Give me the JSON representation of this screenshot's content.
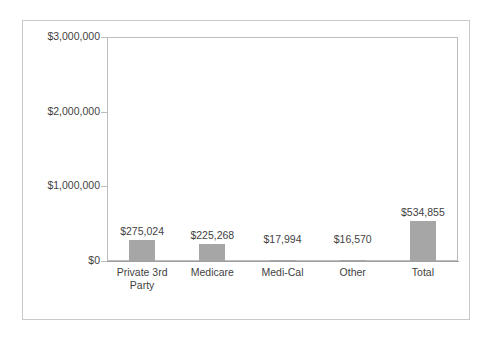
{
  "chart_data": {
    "type": "bar",
    "title": "",
    "subtitle": "",
    "xlabel": "",
    "ylabel": "",
    "categories": [
      "Private 3rd Party",
      "Medicare",
      "Medi-Cal",
      "Other",
      "Total"
    ],
    "values": [
      275024,
      225268,
      17994,
      16570,
      534855
    ],
    "data_labels": [
      "$275,024",
      "$225,268",
      "$17,994",
      "$16,570",
      "$534,855"
    ],
    "ylim": [
      0,
      3000000
    ],
    "ytick_values": [
      0,
      1000000,
      2000000,
      3000000
    ],
    "ytick_labels": [
      "$0",
      "$1,000,000",
      "$2,000,000",
      "$3,000,000"
    ],
    "grid": false,
    "legend": false,
    "legend_position": "none",
    "bar_color": "#a6a6a6",
    "axis_color": "#bdbdbd",
    "text_color": "#3f3f3f",
    "plot_background": "#ffffff",
    "frame_color": "#c9c9c9"
  },
  "axis": {
    "y_labels": [
      {
        "text": "$3,000,000",
        "value": 3000000
      },
      {
        "text": "$2,000,000",
        "value": 2000000
      },
      {
        "text": "$1,000,000",
        "value": 1000000
      },
      {
        "text": "$0",
        "value": 0
      }
    ]
  },
  "series": [
    {
      "category": "Private 3rd Party",
      "category_display": "Private 3rd\nParty",
      "value": 275024,
      "label": "$275,024"
    },
    {
      "category": "Medicare",
      "category_display": "Medicare",
      "value": 225268,
      "label": "$225,268"
    },
    {
      "category": "Medi-Cal",
      "category_display": "Medi-Cal",
      "value": 17994,
      "label": "$17,994"
    },
    {
      "category": "Other",
      "category_display": "Other",
      "value": 16570,
      "label": "$16,570"
    },
    {
      "category": "Total",
      "category_display": "Total",
      "value": 534855,
      "label": "$534,855"
    }
  ]
}
